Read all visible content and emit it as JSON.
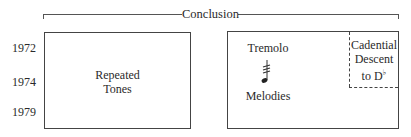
{
  "bracket": {
    "label": "Conclusion"
  },
  "years": [
    "1972",
    "1974",
    "1979"
  ],
  "left_box": {
    "label_line1": "Repeated",
    "label_line2": "Tones"
  },
  "right_box": {
    "top_label": "Tremolo",
    "icon": "tremolo-note-icon",
    "bottom_label": "Melodies",
    "inset": {
      "line1": "Cadential",
      "line2": "Descent",
      "line3_prefix": "to D",
      "line3_accidental": "♭"
    }
  }
}
